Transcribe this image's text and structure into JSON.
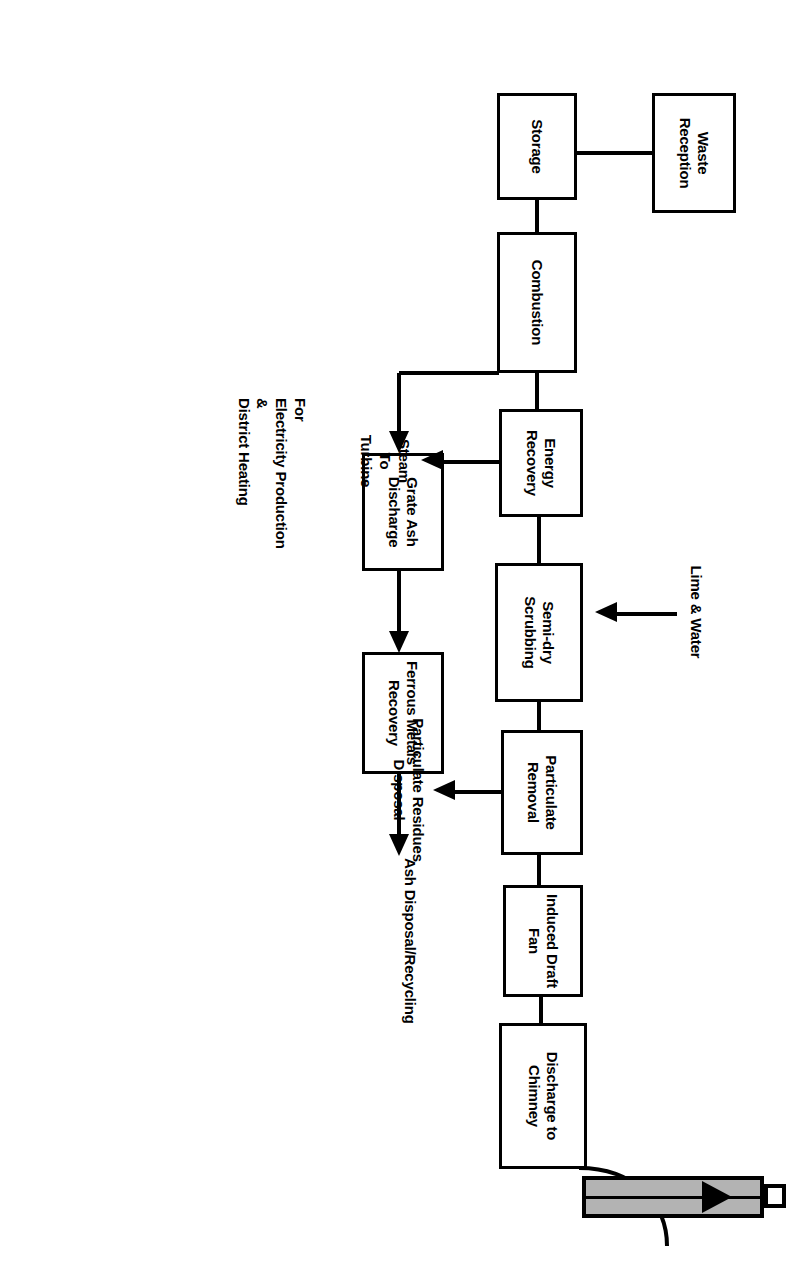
{
  "diagram": {
    "orientation": "rotated-90-clockwise",
    "colors": {
      "stroke": "#000000",
      "background": "#ffffff",
      "chimney_fill": "#b3b3b3"
    },
    "nodes": [
      {
        "id": "waste-reception",
        "label": "Waste\nReception"
      },
      {
        "id": "storage",
        "label": "Storage"
      },
      {
        "id": "combustion",
        "label": "Combustion"
      },
      {
        "id": "energy-recovery",
        "label": "Energy\nRecovery"
      },
      {
        "id": "semi-dry-scrubbing",
        "label": "Semi-dry\nScrubbing"
      },
      {
        "id": "particulate-removal",
        "label": "Particulate\nRemoval"
      },
      {
        "id": "induced-draft-fan",
        "label": "Induced\nDraft Fan"
      },
      {
        "id": "discharge-to-chimney",
        "label": "Discharge\nto\nChimney"
      },
      {
        "id": "grate-ash-discharge",
        "label": "Grate Ash\nDischarge"
      },
      {
        "id": "ferrous-metals-recovery",
        "label": "Ferrous\nMetals\nRecovery"
      }
    ],
    "annotations": [
      {
        "id": "lime-and-water",
        "label": "Lime & Water"
      },
      {
        "id": "steam-to-turbine",
        "label": "Steam\nTo\nTurbine"
      },
      {
        "id": "steam-use-note",
        "label": "For\nElectricity Production\n&\nDistrict Heating"
      },
      {
        "id": "particulate-residues-disposal",
        "label": "Particulate Residues\nDisposal"
      },
      {
        "id": "ash-disposal-recycling",
        "label": "Ash Disposal/Recycling"
      }
    ],
    "chimney": {
      "id": "chimney-stack",
      "label": ""
    }
  }
}
